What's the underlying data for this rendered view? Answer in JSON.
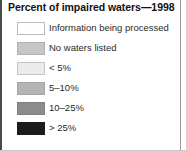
{
  "legend": {
    "title": "Percent of impaired waters—1998",
    "rows": [
      {
        "label": "Information being processed",
        "color": "#fefefe",
        "border": "#bdbdbd"
      },
      {
        "label": "No waters listed",
        "color": "#c6c6c6",
        "border": "#b0b0b0"
      },
      {
        "label": "< 5%",
        "color": "#ebebeb",
        "border": "#c4c4c4"
      },
      {
        "label": "5–10%",
        "color": "#b4b4b4",
        "border": "#a5a5a5"
      },
      {
        "label": "10–25%",
        "color": "#8c8c8c",
        "border": "#818181"
      },
      {
        "label": "> 25%",
        "color": "#1c1c1c",
        "border": "#1c1c1c"
      }
    ]
  }
}
